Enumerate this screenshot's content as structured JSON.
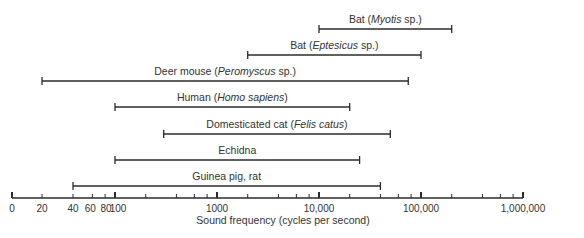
{
  "chart_data": {
    "type": "range-bar",
    "title": "",
    "xlabel": "Sound frequency (cycles per second)",
    "ylabel": "",
    "xscale": "log (with 0, 20, 40 compressed at left)",
    "xlim": [
      0,
      1000000
    ],
    "grid": false,
    "legend": null,
    "x_ticks": [
      {
        "value": 0,
        "label": "0",
        "major": true
      },
      {
        "value": 20,
        "label": "20",
        "major": false
      },
      {
        "value": 40,
        "label": "40",
        "major": false
      },
      {
        "value": 60,
        "label": "60",
        "major": false
      },
      {
        "value": 80,
        "label": "80",
        "major": false
      },
      {
        "value": 100,
        "label": "100",
        "major": true
      },
      {
        "value": 1000,
        "label": "1000",
        "major": true
      },
      {
        "value": 10000,
        "label": "10,000",
        "major": true
      },
      {
        "value": 100000,
        "label": "100,000",
        "major": true
      },
      {
        "value": 1000000,
        "label": "1,000,000",
        "major": true
      }
    ],
    "series": [
      {
        "name": "Bat",
        "scientific": "Myotis",
        "suffix": " sp.)",
        "low": 10000,
        "high": 200000
      },
      {
        "name": "Bat",
        "scientific": "Eptesicus",
        "suffix": " sp.)",
        "low": 2000,
        "high": 100000
      },
      {
        "name": "Deer mouse",
        "scientific": "Peromyscus",
        "suffix": " sp.)",
        "low": 20,
        "high": 75000
      },
      {
        "name": "Human",
        "scientific": "Homo sapiens",
        "suffix": ")",
        "low": 100,
        "high": 20000
      },
      {
        "name": "Domesticated cat",
        "scientific": "Felis catus",
        "suffix": ")",
        "low": 300,
        "high": 50000
      },
      {
        "name": "Echidna",
        "scientific": "",
        "suffix": "",
        "low": 100,
        "high": 25000
      },
      {
        "name": "Guinea pig, rat",
        "scientific": "",
        "suffix": "",
        "low": 40,
        "high": 40000
      }
    ]
  },
  "colors": {
    "line": "#2b2b2b",
    "text": "#333333",
    "background": "#ffffff"
  }
}
